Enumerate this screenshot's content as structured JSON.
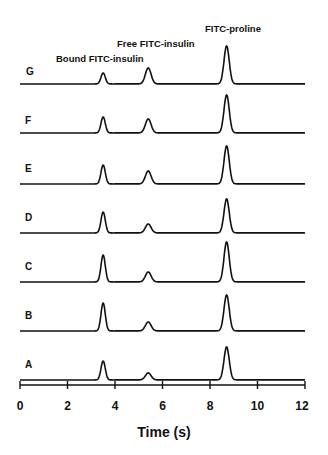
{
  "chart_data": {
    "type": "line",
    "title": "",
    "xlabel": "Time (s)",
    "ylabel": "",
    "xlim": [
      0,
      12
    ],
    "x_ticks": [
      0,
      2,
      4,
      6,
      8,
      10,
      12
    ],
    "grid": false,
    "legend": null,
    "annotations": [
      {
        "text": "Bound FITC-insulin",
        "x": 3.5
      },
      {
        "text": "Free FITC-insulin",
        "x": 5.4
      },
      {
        "text": "FITC-proline",
        "x": 8.7
      }
    ],
    "peak_times": {
      "bound_fitc_insulin": 3.5,
      "free_fitc_insulin": 5.4,
      "fitc_proline": 8.7
    },
    "series": [
      {
        "name": "G",
        "peaks": {
          "bound_fitc_insulin": 11,
          "free_fitc_insulin": 16,
          "fitc_proline": 38
        }
      },
      {
        "name": "F",
        "peaks": {
          "bound_fitc_insulin": 16,
          "free_fitc_insulin": 14,
          "fitc_proline": 38
        }
      },
      {
        "name": "E",
        "peaks": {
          "bound_fitc_insulin": 19,
          "free_fitc_insulin": 13,
          "fitc_proline": 38
        }
      },
      {
        "name": "D",
        "peaks": {
          "bound_fitc_insulin": 21,
          "free_fitc_insulin": 9,
          "fitc_proline": 34
        }
      },
      {
        "name": "C",
        "peaks": {
          "bound_fitc_insulin": 27,
          "free_fitc_insulin": 10,
          "fitc_proline": 40
        }
      },
      {
        "name": "B",
        "peaks": {
          "bound_fitc_insulin": 28,
          "free_fitc_insulin": 9,
          "fitc_proline": 36
        }
      },
      {
        "name": "A",
        "peaks": {
          "bound_fitc_insulin": 19,
          "free_fitc_insulin": 7,
          "fitc_proline": 33
        }
      }
    ],
    "peak_units": "relative height (arbitrary, stacked traces)"
  },
  "labels": {
    "peak_bound": "Bound FITC-insulin",
    "peak_free": "Free FITC-insulin",
    "peak_proline": "FITC-proline",
    "xlabel": "Time (s)",
    "ticks": [
      "0",
      "2",
      "4",
      "6",
      "8",
      "10",
      "12"
    ],
    "traces": [
      "G",
      "F",
      "E",
      "D",
      "C",
      "B",
      "A"
    ]
  }
}
